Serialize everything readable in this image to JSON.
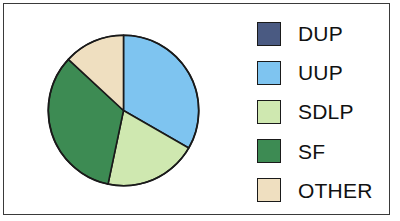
{
  "chart_data": {
    "type": "pie",
    "title": "",
    "labels": [
      "DUP",
      "UUP",
      "SDLP",
      "SF",
      "OTHER"
    ],
    "values": [
      0,
      33.3,
      20.0,
      33.6,
      13.1
    ],
    "units": "percent",
    "colors": [
      "#4a5a82",
      "#7ec4f0",
      "#cfe8b0",
      "#3d8b53",
      "#efdfc0"
    ],
    "start_angle_deg": 0,
    "direction": "clockwise",
    "slice_boundaries_deg": [
      0,
      0,
      121,
      241,
      313,
      360
    ],
    "legend_position": "right",
    "grid": false,
    "slice_edge_color": "#1a1a1a",
    "background_color": "#ffffff",
    "frame_color": "#3a3a3a"
  },
  "legend": {
    "items": [
      {
        "label": "DUP",
        "color": "#4a5a82"
      },
      {
        "label": "UUP",
        "color": "#7ec4f0"
      },
      {
        "label": "SDLP",
        "color": "#cfe8b0"
      },
      {
        "label": "SF",
        "color": "#3d8b53"
      },
      {
        "label": "OTHER",
        "color": "#efdfc0"
      }
    ]
  }
}
